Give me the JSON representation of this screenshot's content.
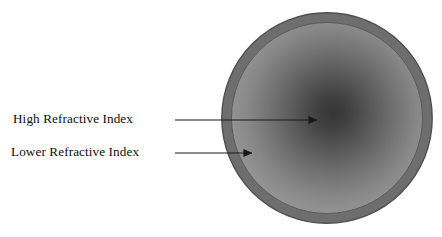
{
  "figure": {
    "width": 442,
    "height": 237,
    "background_color": "#ffffff"
  },
  "labels": {
    "high_refractive_index": "High Refractive Index",
    "lower_refractive_index": "Lower Refractive Index"
  },
  "colors": {
    "cladding_ring": "#6e6e6e",
    "core_center": "#3a3a3a",
    "core_mid": "#7a7a7a",
    "core_edge": "#9b9b9b",
    "outline": "#4a4a4a",
    "arrow": "#1a1a1a",
    "text": "#101010"
  },
  "geometry": {
    "center_x": 327,
    "center_y": 118,
    "outer_radius": 106,
    "inner_radius": 96,
    "ring_thickness": 10,
    "gradient_focus_x": 332,
    "gradient_focus_y": 112
  },
  "arrows": [
    {
      "name": "arrow-high-refractive-index",
      "target": "core-center",
      "x1": 175,
      "y1": 120,
      "x2": 317,
      "y2": 120
    },
    {
      "name": "arrow-lower-refractive-index",
      "target": "core-outer-edge",
      "x1": 175,
      "y1": 153,
      "x2": 252,
      "y2": 153
    }
  ]
}
